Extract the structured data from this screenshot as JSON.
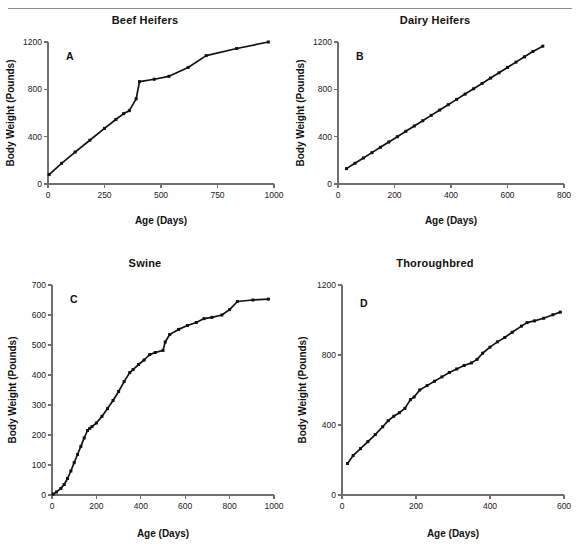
{
  "figure": {
    "divider": "horizontal-rule",
    "shared_axis_labels": {
      "x": "Age (Days)",
      "y": "Body Weight (Pounds)"
    }
  },
  "chart_data": [
    {
      "type": "line",
      "panel_letter": "A",
      "title": "Beef Heifers",
      "xlabel": "Age (Days)",
      "ylabel": "Body Weight (Pounds)",
      "xlim": [
        0,
        1000
      ],
      "ylim": [
        0,
        1200
      ],
      "xticks": [
        0,
        250,
        500,
        750,
        1000
      ],
      "yticks": [
        0,
        400,
        800,
        1200
      ],
      "grid": false,
      "legend": "none",
      "x": [
        5,
        60,
        120,
        185,
        250,
        300,
        335,
        360,
        390,
        405,
        470,
        535,
        620,
        700,
        835,
        975
      ],
      "y": [
        80,
        175,
        270,
        370,
        470,
        545,
        595,
        620,
        720,
        865,
        885,
        910,
        985,
        1085,
        1145,
        1200
      ]
    },
    {
      "type": "line",
      "panel_letter": "B",
      "title": "Dairy Heifers",
      "xlabel": "Age (Days)",
      "ylabel": "Body Weight (Pounds)",
      "xlim": [
        0,
        800
      ],
      "ylim": [
        0,
        1200
      ],
      "xticks": [
        0,
        200,
        400,
        600,
        800
      ],
      "yticks": [
        0,
        400,
        800,
        1200
      ],
      "grid": false,
      "legend": "none",
      "x": [
        30,
        60,
        90,
        120,
        150,
        180,
        210,
        240,
        270,
        300,
        330,
        360,
        390,
        420,
        450,
        480,
        510,
        540,
        570,
        600,
        630,
        660,
        690,
        725
      ],
      "y": [
        130,
        175,
        220,
        265,
        310,
        355,
        400,
        445,
        490,
        535,
        580,
        625,
        670,
        715,
        760,
        805,
        850,
        895,
        940,
        985,
        1030,
        1075,
        1120,
        1165
      ]
    },
    {
      "type": "line",
      "panel_letter": "C",
      "title": "Swine",
      "xlabel": "Age (Days)",
      "ylabel": "Body Weight (Pounds)",
      "xlim": [
        0,
        1000
      ],
      "ylim": [
        0,
        700
      ],
      "xticks": [
        0,
        200,
        400,
        600,
        800,
        1000
      ],
      "yticks": [
        0,
        100,
        200,
        300,
        400,
        500,
        600,
        700
      ],
      "grid": false,
      "legend": "none",
      "x": [
        5,
        20,
        40,
        55,
        70,
        85,
        100,
        115,
        130,
        145,
        160,
        170,
        180,
        200,
        225,
        250,
        275,
        300,
        325,
        350,
        365,
        390,
        415,
        440,
        465,
        500,
        510,
        530,
        570,
        610,
        650,
        685,
        720,
        765,
        800,
        835,
        905,
        975
      ],
      "y": [
        3,
        10,
        22,
        35,
        55,
        80,
        108,
        135,
        162,
        190,
        215,
        222,
        228,
        240,
        262,
        288,
        315,
        345,
        378,
        408,
        418,
        435,
        450,
        468,
        475,
        482,
        510,
        535,
        552,
        565,
        575,
        588,
        592,
        600,
        618,
        645,
        650,
        653
      ]
    },
    {
      "type": "line",
      "panel_letter": "D",
      "title": "Thoroughbred",
      "xlabel": "Age (Days)",
      "ylabel": "Body Weight (Pounds)",
      "xlim": [
        0,
        600
      ],
      "ylim": [
        0,
        1200
      ],
      "xticks": [
        0,
        200,
        400,
        600
      ],
      "yticks": [
        0,
        400,
        800,
        1200
      ],
      "grid": false,
      "legend": "none",
      "x": [
        15,
        30,
        50,
        70,
        90,
        110,
        125,
        140,
        155,
        170,
        185,
        195,
        210,
        230,
        250,
        270,
        290,
        310,
        330,
        350,
        365,
        380,
        400,
        420,
        440,
        460,
        485,
        500,
        520,
        545,
        570,
        590
      ],
      "y": [
        180,
        225,
        265,
        305,
        345,
        390,
        425,
        450,
        470,
        495,
        545,
        560,
        600,
        625,
        650,
        675,
        700,
        720,
        740,
        755,
        775,
        810,
        845,
        875,
        900,
        930,
        965,
        985,
        995,
        1010,
        1030,
        1045
      ]
    }
  ]
}
